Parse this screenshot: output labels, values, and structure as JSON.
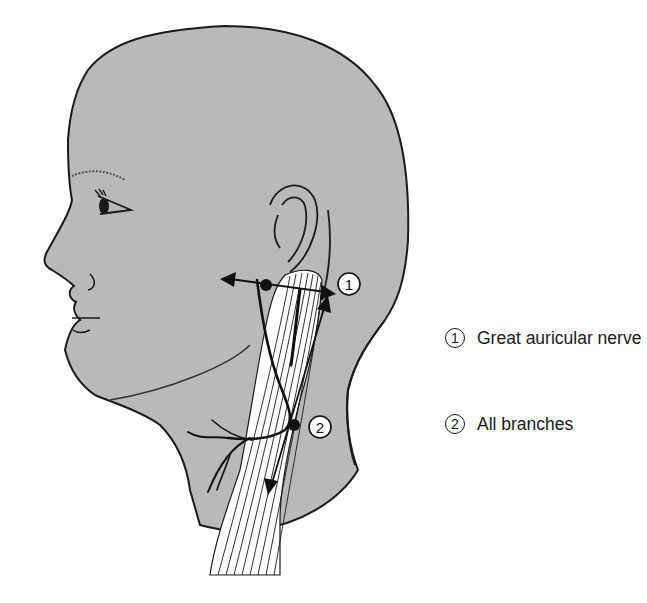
{
  "figure": {
    "colors": {
      "skin": "#b9b9b9",
      "outline": "#1a1a1a",
      "muscle": "#ffffff",
      "background": "#ffffff"
    },
    "markers": [
      {
        "id": "1",
        "label": "1",
        "description": "Injection point with horizontal double-headed arrow below the ear"
      },
      {
        "id": "2",
        "label": "2",
        "description": "Injection point with vertical double-headed arrow along posterior border of sternocleidomastoid"
      }
    ]
  },
  "legend": {
    "items": [
      {
        "number": "1",
        "text": "Great auricular nerve"
      },
      {
        "number": "2",
        "text": "All branches"
      }
    ]
  }
}
